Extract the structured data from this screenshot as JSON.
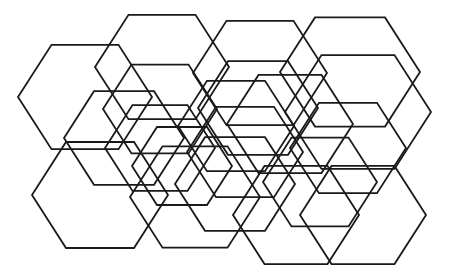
{
  "diagram": {
    "stroke_color": "#1a1a1a",
    "background": "#ffffff",
    "hexagons": [
      {
        "cx": 85,
        "cy": 97,
        "r": 67
      },
      {
        "cx": 162,
        "cy": 67,
        "r": 67
      },
      {
        "cx": 160,
        "cy": 109,
        "r": 57
      },
      {
        "cx": 124,
        "cy": 138,
        "r": 60
      },
      {
        "cx": 160,
        "cy": 148,
        "r": 55
      },
      {
        "cx": 182,
        "cy": 166,
        "r": 50
      },
      {
        "cx": 260,
        "cy": 73,
        "r": 67
      },
      {
        "cx": 350,
        "cy": 72,
        "r": 70
      },
      {
        "cx": 258,
        "cy": 108,
        "r": 60
      },
      {
        "cx": 236,
        "cy": 126,
        "r": 58
      },
      {
        "cx": 290,
        "cy": 124,
        "r": 63
      },
      {
        "cx": 358,
        "cy": 112,
        "r": 73
      },
      {
        "cx": 348,
        "cy": 148,
        "r": 58
      },
      {
        "cx": 320,
        "cy": 182,
        "r": 57
      },
      {
        "cx": 100,
        "cy": 195,
        "r": 68
      },
      {
        "cx": 195,
        "cy": 197,
        "r": 65
      },
      {
        "cx": 235,
        "cy": 184,
        "r": 60
      },
      {
        "cx": 296,
        "cy": 215,
        "r": 63
      },
      {
        "cx": 363,
        "cy": 215,
        "r": 63
      },
      {
        "cx": 245,
        "cy": 152,
        "r": 58
      }
    ]
  }
}
